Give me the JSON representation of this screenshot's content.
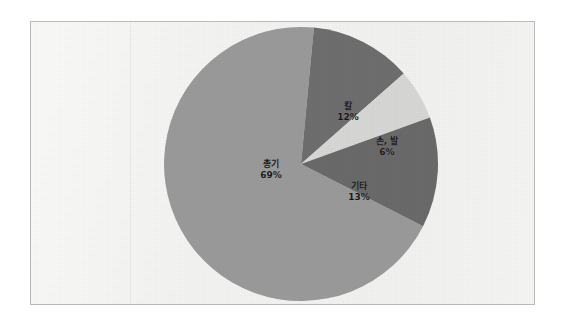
{
  "figure": {
    "background_color": "#f3f3f1",
    "border_color": "#b9b9b7"
  },
  "chart_data": {
    "type": "pie",
    "title": "",
    "subtitle": "",
    "xlabel": "",
    "ylabel": "",
    "legend_position": "none",
    "grid": false,
    "labels_inside": true,
    "label_format": "name + percent",
    "total_percent": 100,
    "categories": [
      "총기",
      "기타",
      "손, 발",
      "칼"
    ],
    "values": [
      69,
      13,
      6,
      12
    ],
    "slices": [
      {
        "name": "총기",
        "percent_label": "69%",
        "value": 69,
        "color": "#9a9a9a",
        "start_angle_deg": 27,
        "end_angle_deg": 275.4,
        "label_name": "총기",
        "label_value": "69%"
      },
      {
        "name": "칼",
        "percent_label": "12%",
        "value": 12,
        "color": "#6e6e6e",
        "start_angle_deg": 318.6,
        "end_angle_deg": 361.8,
        "label_name": "칼",
        "label_value": "12%"
      },
      {
        "name": "손, 발",
        "percent_label": "6%",
        "value": 6,
        "color": "#d7d7d5",
        "start_angle_deg": 340.2,
        "end_angle_deg": 361.8,
        "label_name": "손, 발",
        "label_value": "6%"
      },
      {
        "name": "기타",
        "percent_label": "13%",
        "value": 13,
        "color": "#6a6a6a",
        "start_angle_deg": 0,
        "end_angle_deg": 27,
        "label_name": "기타",
        "label_value": "13%"
      }
    ],
    "colors": {
      "chongi": "#9a9a9a",
      "kal": "#6e6e6e",
      "sonbal": "#d7d7d5",
      "gita": "#6a6a6a",
      "label_text": "#1a1a1a"
    }
  }
}
